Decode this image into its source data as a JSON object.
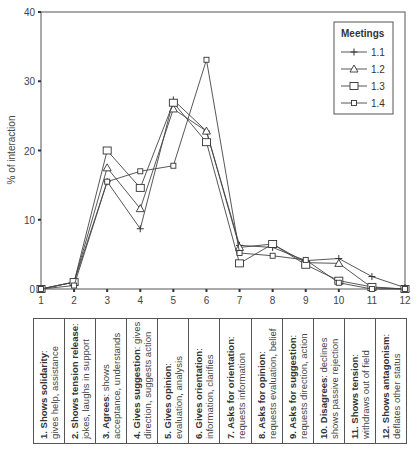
{
  "chart_data": {
    "type": "line",
    "title": "",
    "xlabel": "",
    "ylabel": "% of interaction",
    "ylim": [
      0,
      40
    ],
    "xlim": [
      1,
      12
    ],
    "yticks": [
      0,
      10,
      20,
      30,
      40
    ],
    "x": [
      1,
      2,
      3,
      4,
      5,
      6,
      7,
      8,
      9,
      10,
      11,
      12
    ],
    "grid": false,
    "legend": {
      "title": "Meetings",
      "position": "top-right"
    },
    "series": [
      {
        "name": "1.1",
        "marker": "plus",
        "values": [
          0,
          1.0,
          15.5,
          8.7,
          27.3,
          22.8,
          6.3,
          6.0,
          4.1,
          4.4,
          1.8,
          0.2
        ]
      },
      {
        "name": "1.2",
        "marker": "triangle",
        "values": [
          0,
          1.0,
          17.5,
          11.6,
          26.0,
          22.8,
          6.0,
          6.5,
          3.8,
          3.7,
          0.2,
          0
        ]
      },
      {
        "name": "1.3",
        "marker": "square-open",
        "values": [
          0,
          1.0,
          20.0,
          14.6,
          26.9,
          21.2,
          3.7,
          6.5,
          3.5,
          1.2,
          0.3,
          0
        ]
      },
      {
        "name": "1.4",
        "marker": "square-small",
        "values": [
          0,
          0.5,
          15.5,
          17.0,
          17.8,
          33.1,
          5.2,
          4.8,
          4.2,
          0.9,
          0,
          0
        ]
      }
    ]
  },
  "categories": [
    {
      "title": "1. Shows solidarity",
      "sep": ":",
      "desc": "gives help, assistance"
    },
    {
      "title": "2. Shows tension release",
      "sep": ":",
      "desc": "jokes, laughs in support"
    },
    {
      "title": "3. Agrees",
      "sep": ": shows",
      "desc": "acceptance, understands"
    },
    {
      "title": "4. Gives suggestion",
      "sep": ": gives",
      "desc": "direction, suggests action"
    },
    {
      "title": "5. Gives opinion",
      "sep": ":",
      "desc": "evaluation, analysis"
    },
    {
      "title": "6. Gives orientation",
      "sep": ":",
      "desc": "information, clarifies"
    },
    {
      "title": "7. Asks for orientation",
      "sep": ":",
      "desc": "requests information"
    },
    {
      "title": "8. Asks for opinion",
      "sep": ":",
      "desc": "requests evaluation, belief"
    },
    {
      "title": "9. Asks for suggestion",
      "sep": ":",
      "desc": "requests direction, action"
    },
    {
      "title": "10. Disagrees",
      "sep": ": declines",
      "desc": "shows passive rejection"
    },
    {
      "title": "11. Shows tension",
      "sep": ":",
      "desc": "withdraws out of field"
    },
    {
      "title": "12. Shows antagonism",
      "sep": ":",
      "desc": "deflates other status"
    }
  ]
}
